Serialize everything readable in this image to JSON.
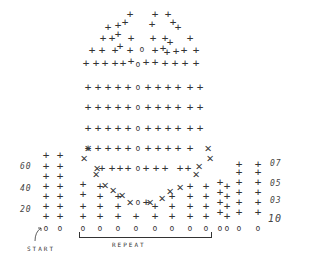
{
  "diagram": {
    "type": "crochet-stitch-chart",
    "legend_symbols": {
      "plus": "+",
      "chain": "o",
      "cross": "x"
    },
    "left_row_labels": [
      {
        "text": "60",
        "x": 20,
        "y": 167
      },
      {
        "text": "40",
        "x": 20,
        "y": 189
      },
      {
        "text": "20",
        "x": 20,
        "y": 210
      }
    ],
    "right_row_labels": [
      {
        "text": "07",
        "x": 272,
        "y": 164
      },
      {
        "text": "05",
        "x": 272,
        "y": 184
      },
      {
        "text": "03",
        "x": 272,
        "y": 201
      },
      {
        "text": "10",
        "x": 270,
        "y": 218
      }
    ],
    "start_label": "START",
    "repeat_label": "REPEAT",
    "colors": {
      "ink": "#333333",
      "background": "#ffffff"
    }
  }
}
